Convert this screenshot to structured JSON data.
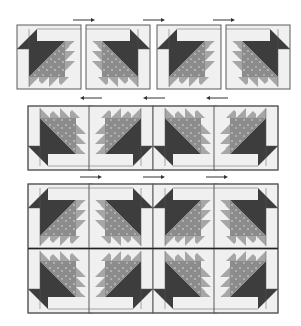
{
  "diagram": {
    "title": "",
    "colors": {
      "background": "#ffffff",
      "light": "#f0f0f0",
      "dark": "#3d3d3d",
      "print": "#8c8c8c",
      "medium": "#a6a6a6",
      "seam": "#5a5a5a",
      "arrow": "#333333"
    },
    "steps": [
      {
        "name": "row-1-single-blocks",
        "block_count": 4,
        "arrows": [
          "right",
          "right",
          "right"
        ]
      },
      {
        "name": "row-2-block-pairs",
        "block_count": 4,
        "arrows": [
          "left",
          "left",
          "left"
        ]
      },
      {
        "name": "row-3-assembled-units",
        "block_count": 8,
        "arrows": [
          "right",
          "right",
          "right"
        ]
      }
    ]
  }
}
